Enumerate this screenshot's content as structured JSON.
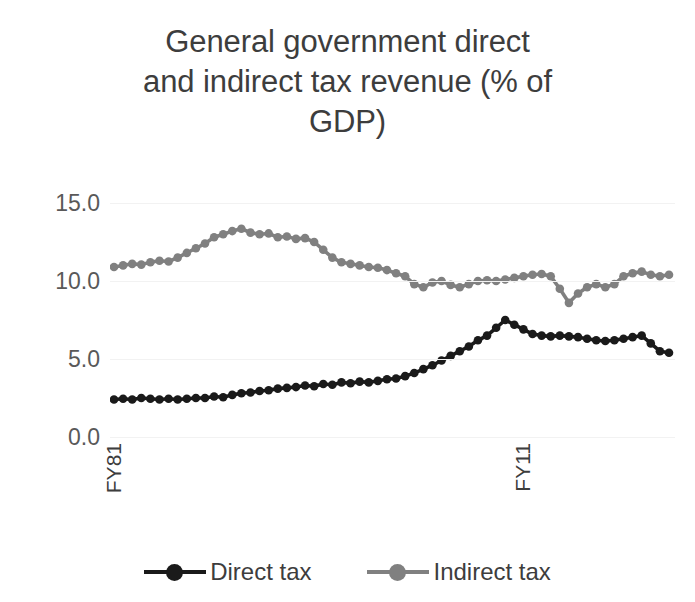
{
  "chart_data": {
    "type": "line",
    "title": "General government direct and indirect tax revenue (% of GDP)",
    "title_lines": [
      "General government direct",
      "and indirect tax revenue (% of",
      "GDP)"
    ],
    "xlabel": "",
    "ylabel": "",
    "ylim": [
      0,
      15
    ],
    "yticks": [
      "0.0",
      "5.0",
      "10.0",
      "15.0"
    ],
    "ytick_values": [
      0,
      5,
      10,
      15
    ],
    "xticks": [
      "FY81",
      "FY11"
    ],
    "xtick_indices": [
      0,
      45
    ],
    "grid": true,
    "legend_position": "bottom",
    "marker": "circle",
    "categories": [
      "FY81",
      "FY82",
      "FY83",
      "FY84",
      "FY85",
      "FY86",
      "FY87",
      "FY88",
      "FY89",
      "FY90",
      "FY91",
      "FY92",
      "FY93",
      "FY94",
      "FY95",
      "FY96",
      "FY97",
      "FY98",
      "FY99",
      "FY00",
      "FY01",
      "FY02",
      "FY03",
      "FY04",
      "FY05",
      "FY06",
      "FY07",
      "FY08",
      "FY09",
      "FY10",
      "FY11",
      "FY12",
      "FY13",
      "FY14",
      "FY15",
      "FY16",
      "FY17",
      "FY18",
      "FY19",
      "FY20",
      "FY21",
      "FY22",
      "FY23",
      "FY24",
      "FY25",
      "FY26",
      "FY27",
      "FY28",
      "FY29",
      "FY30",
      "FY31",
      "FY32",
      "FY33",
      "FY34",
      "FY35",
      "FY36",
      "FY37",
      "FY38",
      "FY39",
      "FY40",
      "FY41",
      "FY42"
    ],
    "series": [
      {
        "name": "Direct tax",
        "color": "#1a1a1a",
        "values": [
          2.4,
          2.45,
          2.4,
          2.5,
          2.45,
          2.4,
          2.45,
          2.4,
          2.45,
          2.5,
          2.5,
          2.6,
          2.55,
          2.7,
          2.8,
          2.85,
          2.95,
          3.0,
          3.1,
          3.15,
          3.2,
          3.3,
          3.25,
          3.4,
          3.35,
          3.5,
          3.45,
          3.55,
          3.5,
          3.6,
          3.7,
          3.75,
          3.9,
          4.1,
          4.35,
          4.6,
          4.9,
          5.2,
          5.5,
          5.8,
          6.2,
          6.5,
          7.0,
          7.5,
          7.2,
          6.9,
          6.6,
          6.5,
          6.45,
          6.5,
          6.45,
          6.4,
          6.3,
          6.2,
          6.15,
          6.2,
          6.3,
          6.4,
          6.5,
          6.0,
          5.5,
          5.4
        ]
      },
      {
        "name": "Indirect tax",
        "color": "#808080",
        "values": [
          10.9,
          11.0,
          11.1,
          11.05,
          11.2,
          11.3,
          11.25,
          11.5,
          11.8,
          12.1,
          12.4,
          12.8,
          13.0,
          13.2,
          13.35,
          13.1,
          13.0,
          13.05,
          12.8,
          12.85,
          12.7,
          12.75,
          12.5,
          12.0,
          11.5,
          11.2,
          11.1,
          11.0,
          10.9,
          10.85,
          10.7,
          10.5,
          10.3,
          9.8,
          9.6,
          9.9,
          10.0,
          9.75,
          9.6,
          9.8,
          10.0,
          10.05,
          10.0,
          10.1,
          10.2,
          10.3,
          10.4,
          10.45,
          10.3,
          9.5,
          8.6,
          9.2,
          9.6,
          9.8,
          9.6,
          9.8,
          10.3,
          10.5,
          10.6,
          10.4,
          10.3,
          10.4
        ]
      }
    ]
  },
  "legend": {
    "items": [
      {
        "label": "Direct tax",
        "color": "#1a1a1a"
      },
      {
        "label": "Indirect tax",
        "color": "#808080"
      }
    ]
  }
}
